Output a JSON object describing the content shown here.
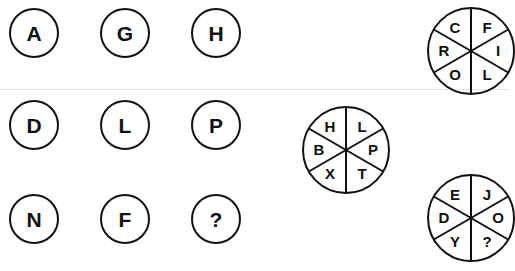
{
  "grid": {
    "rows": [
      [
        "A",
        "G",
        "H"
      ],
      [
        "D",
        "L",
        "P"
      ],
      [
        "N",
        "F",
        "?"
      ]
    ]
  },
  "wheels": [
    {
      "name": "middle-wheel",
      "segments": {
        "top_left": "H",
        "top_right": "L",
        "left": "B",
        "right": "P",
        "bottom_left": "X",
        "bottom_right": "T"
      }
    },
    {
      "name": "top-right-wheel",
      "segments": {
        "top_left": "C",
        "top_right": "F",
        "left": "R",
        "right": "I",
        "bottom_left": "O",
        "bottom_right": "L"
      }
    },
    {
      "name": "bottom-right-wheel",
      "segments": {
        "top_left": "E",
        "top_right": "J",
        "left": "D",
        "right": "O",
        "bottom_left": "Y",
        "bottom_right": "?"
      }
    }
  ]
}
